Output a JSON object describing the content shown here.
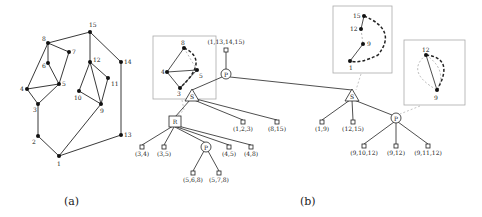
{
  "panel_a": {
    "caption": "(a)",
    "vertices": [
      {
        "id": "1",
        "x": 59,
        "y": 156
      },
      {
        "id": "2",
        "x": 38,
        "y": 136
      },
      {
        "id": "3",
        "x": 38,
        "y": 104
      },
      {
        "id": "4",
        "x": 27,
        "y": 89
      },
      {
        "id": "5",
        "x": 59,
        "y": 84
      },
      {
        "id": "6",
        "x": 48,
        "y": 63
      },
      {
        "id": "7",
        "x": 69,
        "y": 52
      },
      {
        "id": "8",
        "x": 48,
        "y": 43
      },
      {
        "id": "9",
        "x": 101,
        "y": 104
      },
      {
        "id": "10",
        "x": 79,
        "y": 91
      },
      {
        "id": "11",
        "x": 108,
        "y": 78
      },
      {
        "id": "12",
        "x": 90,
        "y": 62
      },
      {
        "id": "13",
        "x": 121,
        "y": 135
      },
      {
        "id": "14",
        "x": 121,
        "y": 62
      },
      {
        "id": "15",
        "x": 90,
        "y": 32
      }
    ]
  },
  "panel_b": {
    "caption": "(b)",
    "nodes": [
      {
        "id": "root",
        "type": "Q",
        "label": "(1,13,14,15)",
        "x": 226,
        "y": 50
      },
      {
        "id": "P1",
        "type": "P",
        "label": "P",
        "x": 226,
        "y": 74
      },
      {
        "id": "S1",
        "type": "S",
        "label": "S",
        "x": 192,
        "y": 96
      },
      {
        "id": "S2",
        "type": "S",
        "label": "S",
        "x": 352,
        "y": 96
      },
      {
        "id": "R",
        "type": "R",
        "label": "R",
        "x": 175,
        "y": 122
      },
      {
        "id": "q123",
        "type": "Q",
        "label": "(1,2,3)",
        "x": 243,
        "y": 122
      },
      {
        "id": "q815",
        "type": "Q",
        "label": "(8,15)",
        "x": 277,
        "y": 122
      },
      {
        "id": "q34",
        "type": "Q",
        "label": "(3,4)",
        "x": 142,
        "y": 147
      },
      {
        "id": "q35",
        "type": "Q",
        "label": "(3,5)",
        "x": 164,
        "y": 147
      },
      {
        "id": "P2",
        "type": "P",
        "label": "P",
        "x": 206,
        "y": 147
      },
      {
        "id": "q45",
        "type": "Q",
        "label": "(4,5)",
        "x": 229,
        "y": 147
      },
      {
        "id": "q48",
        "type": "Q",
        "label": "(4,8)",
        "x": 251,
        "y": 147
      },
      {
        "id": "q568",
        "type": "Q",
        "label": "(5,6,8)",
        "x": 193,
        "y": 173
      },
      {
        "id": "q578",
        "type": "Q",
        "label": "(5,7,8)",
        "x": 219,
        "y": 173
      },
      {
        "id": "q19",
        "type": "Q",
        "label": "(1,9)",
        "x": 322,
        "y": 122
      },
      {
        "id": "q1215",
        "type": "Q",
        "label": "(12,15)",
        "x": 353,
        "y": 122
      },
      {
        "id": "P3",
        "type": "P",
        "label": "P",
        "x": 396,
        "y": 118
      },
      {
        "id": "q91012",
        "type": "Q",
        "label": "(9,10,12)",
        "x": 364,
        "y": 146
      },
      {
        "id": "q912",
        "type": "Q",
        "label": "(9,12)",
        "x": 396,
        "y": 146
      },
      {
        "id": "q91112",
        "type": "Q",
        "label": "(9,11,12)",
        "x": 428,
        "y": 146
      }
    ],
    "skeleton_boxes": [
      {
        "id": "skel-R",
        "vertex_labels": [
          "8",
          "4",
          "5",
          "3"
        ]
      },
      {
        "id": "skel-S2",
        "vertex_labels": [
          "15",
          "12",
          "9",
          "1"
        ]
      },
      {
        "id": "skel-P3",
        "vertex_labels": [
          "12",
          "9"
        ]
      }
    ]
  }
}
